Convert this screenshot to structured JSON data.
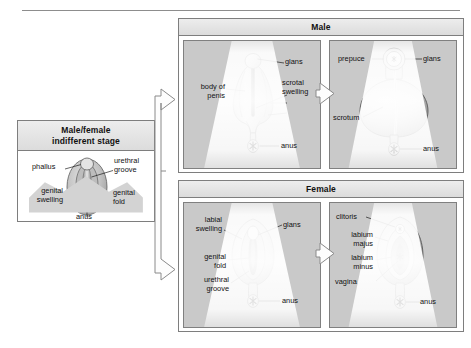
{
  "diagram": {
    "top_rule": true
  },
  "indifferent": {
    "header_line1": "Male/female",
    "header_line2": "indifferent stage",
    "labels": {
      "phallus": "phallus",
      "urethral_groove_line1": "urethral",
      "urethral_groove_line2": "groove",
      "genital_swelling_line1": "genital",
      "genital_swelling_line2": "swelling",
      "genital_fold_line1": "genital",
      "genital_fold_line2": "fold",
      "anus": "anus"
    }
  },
  "male": {
    "header": "Male",
    "early": {
      "labels": {
        "glans": "glans",
        "body_of_penis_line1": "body of",
        "body_of_penis_line2": "penis",
        "scrotal_swelling_line1": "scrotal",
        "scrotal_swelling_line2": "swelling",
        "anus": "anus"
      }
    },
    "late": {
      "labels": {
        "prepuce": "prepuce",
        "glans": "glans",
        "scrotum": "scrotum",
        "anus": "anus"
      }
    }
  },
  "female": {
    "header": "Female",
    "early": {
      "labels": {
        "labial_swelling_line1": "labial",
        "labial_swelling_line2": "swelling",
        "glans": "glans",
        "genital_fold_line1": "genital",
        "genital_fold_line2": "fold",
        "urethral_groove_line1": "urethral",
        "urethral_groove_line2": "groove",
        "anus": "anus"
      }
    },
    "late": {
      "labels": {
        "clitoris": "clitoris",
        "labium_majus_line1": "labium",
        "labium_majus_line2": "majus",
        "labium_minus_line1": "labium",
        "labium_minus_line2": "minus",
        "vagina": "vagina",
        "anus": "anus"
      }
    }
  },
  "colors": {
    "panel_border": "#7e7e7e",
    "panel_header_bg": "#e4e4e4",
    "subpanel_bg": "#c9c9c9",
    "tissue_light": "#d6d6d6",
    "tissue_mid": "#b3b3b3",
    "tissue_dark": "#6f6f6f",
    "text": "#111111",
    "arrow_fill": "#fdfdfd"
  }
}
